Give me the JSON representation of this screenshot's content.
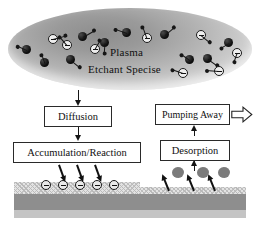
{
  "figure": {
    "background_color": "#ffffff"
  },
  "plasma": {
    "label_primary": "Plasma",
    "label_secondary": "Etchant Specise",
    "shape": "ellipse",
    "fill_description": "radial gray gradient",
    "particles": [
      {
        "type": "radical",
        "glyph": "filled-dark-circle",
        "x": 22,
        "y": 45,
        "tail_angle_deg": 205,
        "tail_len": 11
      },
      {
        "type": "radical",
        "glyph": "filled-dark-circle",
        "x": 40,
        "y": 58,
        "tail_angle_deg": 250,
        "tail_len": 10
      },
      {
        "type": "radical",
        "glyph": "filled-dark-circle",
        "x": 66,
        "y": 55,
        "tail_angle_deg": 40,
        "tail_len": 12
      },
      {
        "type": "radical",
        "glyph": "filled-dark-circle",
        "x": 78,
        "y": 32,
        "tail_angle_deg": 330,
        "tail_len": 14
      },
      {
        "type": "radical",
        "glyph": "filled-dark-circle",
        "x": 100,
        "y": 38,
        "tail_angle_deg": 95,
        "tail_len": 11
      },
      {
        "type": "radical",
        "glyph": "filled-dark-circle",
        "x": 122,
        "y": 28,
        "tail_angle_deg": 200,
        "tail_len": 13
      },
      {
        "type": "radical",
        "glyph": "filled-dark-circle",
        "x": 160,
        "y": 30,
        "tail_angle_deg": 320,
        "tail_len": 13
      },
      {
        "type": "radical",
        "glyph": "filled-dark-circle",
        "x": 185,
        "y": 55,
        "tail_angle_deg": 215,
        "tail_len": 11
      },
      {
        "type": "radical",
        "glyph": "filled-dark-circle",
        "x": 203,
        "y": 54,
        "tail_angle_deg": 35,
        "tail_len": 12
      },
      {
        "type": "radical",
        "glyph": "filled-dark-circle",
        "x": 224,
        "y": 38,
        "tail_angle_deg": 150,
        "tail_len": 10
      },
      {
        "type": "ion",
        "glyph": "open-circle-minus",
        "x": 48,
        "y": 34,
        "tail_angle_deg": 345,
        "tail_len": 14
      },
      {
        "type": "ion",
        "glyph": "open-circle-minus",
        "x": 62,
        "y": 40,
        "tail_angle_deg": 230,
        "tail_len": 12
      },
      {
        "type": "ion",
        "glyph": "open-circle-minus",
        "x": 90,
        "y": 44,
        "tail_angle_deg": 300,
        "tail_len": 11
      },
      {
        "type": "ion",
        "glyph": "open-circle-minus",
        "x": 142,
        "y": 33,
        "tail_angle_deg": 250,
        "tail_len": 13
      },
      {
        "type": "ion",
        "glyph": "open-circle-minus",
        "x": 196,
        "y": 30,
        "tail_angle_deg": 40,
        "tail_len": 12
      },
      {
        "type": "ion",
        "glyph": "open-circle-minus",
        "x": 178,
        "y": 68,
        "tail_angle_deg": 200,
        "tail_len": 12
      },
      {
        "type": "ion",
        "glyph": "open-circle-minus",
        "x": 214,
        "y": 66,
        "tail_angle_deg": 185,
        "tail_len": 13
      },
      {
        "type": "ion",
        "glyph": "open-circle-minus",
        "x": 232,
        "y": 48,
        "tail_angle_deg": 110,
        "tail_len": 10
      }
    ]
  },
  "flow": {
    "boxes": [
      {
        "id": "diffusion",
        "label": "Diffusion",
        "column": "left"
      },
      {
        "id": "accumulation",
        "label": "Accumulation/Reaction",
        "column": "left"
      },
      {
        "id": "desorption",
        "label": "Desorption",
        "column": "right"
      },
      {
        "id": "pumping",
        "label": "Pumping Away",
        "column": "right"
      }
    ],
    "exhaust_arrow": {
      "name": "pumping-away-arrow",
      "direction": "right",
      "style": "hollow-outline"
    }
  },
  "substrate": {
    "layers": [
      {
        "name": "film-left",
        "style": "cross-hatched",
        "thickness_label": "thick"
      },
      {
        "name": "film-right",
        "style": "cross-hatched",
        "thickness_label": "etched-thin"
      },
      {
        "name": "bulk",
        "color": "#8e8e8e"
      },
      {
        "name": "base",
        "color": "#c4c4c4"
      }
    ],
    "adsorbed_species": {
      "count": 5,
      "glyph": "open-circle-minus"
    },
    "incoming_arrows": {
      "count": 3,
      "direction": "down-right"
    },
    "desorbed_blobs": {
      "count": 3,
      "glyph": "gray-blob"
    },
    "outgoing_arrows": {
      "count": 3,
      "direction": "up-right"
    }
  }
}
